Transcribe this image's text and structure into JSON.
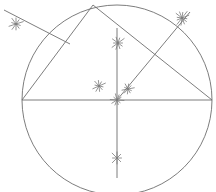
{
  "figure": {
    "title": "Compass and straightedge construction: triangle inscribed in a circle",
    "background_color": "#ffffff",
    "stroke_color": "#6e6e6e",
    "arc_stroke_color": "#7a7a7a",
    "line_width": 0.9,
    "arc_width": 0.8,
    "canvas": {
      "width": 216,
      "height": 192
    }
  },
  "chart_data": {
    "type": "diagram",
    "circle": {
      "name": "circumscribed-circle",
      "cx": 117,
      "cy": 100,
      "r": 95
    },
    "points": [
      {
        "name": "center",
        "label": "O",
        "x": 117,
        "y": 100
      },
      {
        "name": "left-vertex",
        "label": "A",
        "x": 22,
        "y": 100
      },
      {
        "name": "right-vertex",
        "label": "B",
        "x": 212,
        "y": 100
      },
      {
        "name": "apex-vertex",
        "label": "C",
        "x": 93,
        "y": 5
      }
    ],
    "lines": [
      {
        "name": "horizontal-diameter",
        "x1": 22,
        "y1": 100,
        "x2": 212,
        "y2": 100
      },
      {
        "name": "vertical-line",
        "x1": 117,
        "y1": 28,
        "x2": 117,
        "y2": 178
      },
      {
        "name": "side-left",
        "x1": 22,
        "y1": 100,
        "x2": 93,
        "y2": 5
      },
      {
        "name": "side-right",
        "x1": 93,
        "y1": 5,
        "x2": 212,
        "y2": 100
      },
      {
        "name": "ray-left-to-upper-left",
        "x1": 70,
        "y1": 44,
        "x2": 4,
        "y2": 10
      },
      {
        "name": "median-center-to-upper-right",
        "x1": 117,
        "y1": 100,
        "x2": 190,
        "y2": 12
      }
    ],
    "arc_marks": [
      {
        "name": "mark-outer-upper-left",
        "x": 16,
        "y": 24,
        "size": 13,
        "strokes": 5,
        "rotation": 18
      },
      {
        "name": "mark-outer-upper-right",
        "x": 182,
        "y": 18,
        "size": 14,
        "strokes": 6,
        "rotation": 8
      },
      {
        "name": "mark-upper-center",
        "x": 118,
        "y": 43,
        "size": 13,
        "strokes": 5,
        "rotation": 0
      },
      {
        "name": "mark-mid-left-diagonal",
        "x": 99,
        "y": 86,
        "size": 12,
        "strokes": 5,
        "rotation": 12
      },
      {
        "name": "mark-right-of-center",
        "x": 128,
        "y": 89,
        "size": 11,
        "strokes": 5,
        "rotation": 25
      },
      {
        "name": "mark-center-point",
        "x": 117,
        "y": 100,
        "size": 12,
        "strokes": 5,
        "rotation": 40
      },
      {
        "name": "mark-below-center",
        "x": 117,
        "y": 158,
        "size": 13,
        "strokes": 4,
        "rotation": 0
      }
    ],
    "xlabel": "",
    "ylabel": "",
    "grid": false,
    "legend": false
  }
}
